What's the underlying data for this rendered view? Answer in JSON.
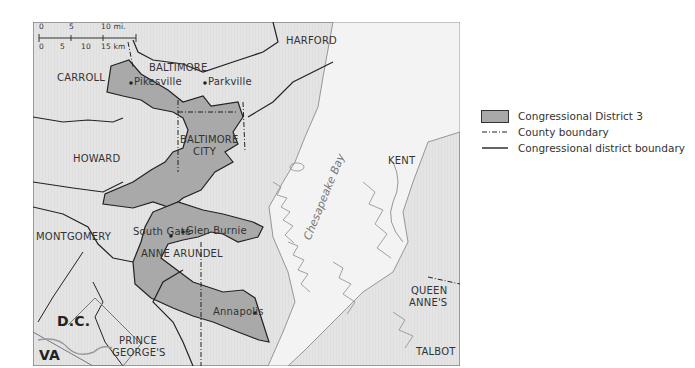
{
  "map": {
    "title": "Congressional District 3 (Maryland)",
    "colors": {
      "land": "#e6e6e6",
      "water": "#f4f4f4",
      "district_fill": "#a9a9a9",
      "boundary": "#222222",
      "shoreline": "#8c8c8c"
    },
    "scale_bar": {
      "miles": [
        "0",
        "5",
        "10 mi."
      ],
      "km": [
        "0",
        "5",
        "10",
        "15 km"
      ]
    },
    "counties": [
      {
        "name": "CARROLL"
      },
      {
        "name": "BALTIMORE"
      },
      {
        "name": "HARFORD"
      },
      {
        "name": "BALTIMORE"
      },
      {
        "name": "CITY"
      },
      {
        "name": "HOWARD"
      },
      {
        "name": "KENT"
      },
      {
        "name": "MONTGOMERY"
      },
      {
        "name": "ANNE ARUNDEL"
      },
      {
        "name": "QUEEN"
      },
      {
        "name": "ANNE'S"
      },
      {
        "name": "PRINCE"
      },
      {
        "name": "GEORGE'S"
      },
      {
        "name": "TALBOT"
      }
    ],
    "places": [
      {
        "name": "Pikesville"
      },
      {
        "name": "Parkville"
      },
      {
        "name": "South Gate"
      },
      {
        "name": "Glen Burnie"
      },
      {
        "name": "Annapolis"
      }
    ],
    "regions": [
      {
        "name": "D.C."
      },
      {
        "name": "VA"
      }
    ],
    "water_label": "Chesapeake Bay"
  },
  "legend": {
    "items": [
      {
        "label": "Congressional District 3",
        "symbol": "gray-fill"
      },
      {
        "label": "County boundary",
        "symbol": "dash-dot-line"
      },
      {
        "label": "Congressional district boundary",
        "symbol": "solid-line"
      }
    ]
  }
}
